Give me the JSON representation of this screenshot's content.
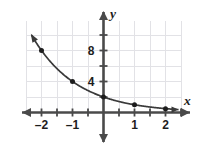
{
  "chart_data": {
    "type": "line",
    "title": "",
    "subtitle": "",
    "xlabel": "x",
    "ylabel": "y",
    "function_label": "y = 2(1/2)^x",
    "xlim": [
      -2.5,
      2.5
    ],
    "ylim": [
      -1.5,
      11
    ],
    "xticks": [
      -2,
      -1,
      1,
      2
    ],
    "yticks": [
      4,
      8
    ],
    "xtick_labels": [
      "–2",
      "–1",
      "1",
      "2"
    ],
    "ytick_labels": [
      "4",
      "8"
    ],
    "x_minor_tick_step": 0.5,
    "y_minor_tick_step": 2,
    "grid": true,
    "grid_x_step": 0.5,
    "grid_y_step": 2,
    "legend": "none",
    "x": [
      -2,
      -1,
      0,
      1,
      2
    ],
    "values": [
      8,
      4,
      2,
      1,
      0.5
    ],
    "points": [
      {
        "x": -2,
        "y": 8
      },
      {
        "x": -1,
        "y": 4
      },
      {
        "x": 0,
        "y": 2
      },
      {
        "x": 1,
        "y": 1
      },
      {
        "x": 2,
        "y": 0.5
      }
    ],
    "curve_has_left_arrow": true,
    "curve_has_right_arrow": true,
    "colors": {
      "curve": "#3a3a3a",
      "point": "#1d1d1d",
      "axis": "#4a4a4a",
      "grid": "#e2e2e6",
      "label": "#1d1d1d",
      "background": "#ffffff"
    }
  },
  "axis_labels": {
    "x": "x",
    "y": "y"
  }
}
